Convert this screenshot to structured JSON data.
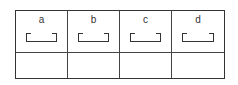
{
  "diagram": {
    "columns": [
      {
        "label": "a",
        "shape": "open-tray-bracket"
      },
      {
        "label": "b",
        "shape": "open-tray-bracket"
      },
      {
        "label": "c",
        "shape": "open-tray-bracket"
      },
      {
        "label": "d",
        "shape": "open-tray-bracket"
      }
    ],
    "rows": 2,
    "bottom_row": [
      "",
      "",
      "",
      ""
    ],
    "colors": {
      "line": "#333333",
      "background": "#ffffff"
    }
  }
}
